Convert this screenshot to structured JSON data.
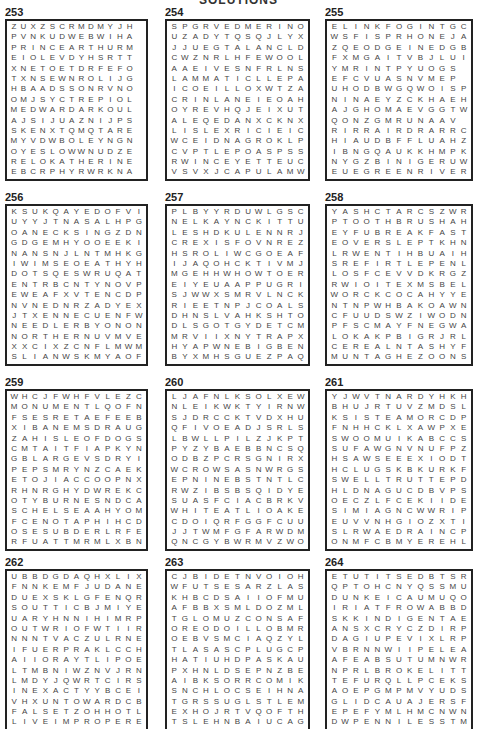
{
  "header": {
    "title": "SOLUTIONS"
  },
  "puzzles": [
    {
      "number": "253",
      "x": 5,
      "y": 6,
      "w": 143,
      "cols": 14,
      "rows": [
        "ZUXZSCRMDMYJH",
        "PVNKUDWEBWIHA",
        "PRINCEARTHURM",
        "EIOLEVDYHSRTT",
        "XNETOETDRFEFO",
        "TXNSEWNROLIJG",
        "HBAADSSONRVNO",
        "OMJSYCTREPIOL",
        "MEDWARDARKOUL",
        "AJSIJUAZNIJPS",
        "SKENXTQMQTARE",
        "MYVDWBOLEYNGN",
        "OYESLOWWNUDZE",
        "RELOKATHERINE",
        "EBCRPHYRWRKNA"
      ]
    },
    {
      "number": "254",
      "x": 165,
      "y": 6,
      "w": 145,
      "cols": 13,
      "rows": [
        "SPGRVEDMERINO",
        "UZADYTQSQJLYX",
        "JJUEGTALANCLD",
        "CWZNRLHFEWOOL",
        "AAEIVESNFRLNS",
        "LAMMATICLLEPAM",
        "ICOEILLOXWTZA",
        "CRINLANEIEOAH",
        "OYREVHQJEIXUT",
        "ALEQEDANXCKNX",
        "LISLEXRICIEIC",
        "WCEIDNAGROKLP",
        "CVPTLEPOASPSS",
        "RWINCEYETTEUC",
        "VSVXJCAPULAMW"
      ]
    },
    {
      "number": "255",
      "x": 325,
      "y": 6,
      "w": 148,
      "cols": 13,
      "rows": [
        "ELINKFOGINTGC",
        "WSFISPRHONEJA",
        "ZQEODGEINEDGB",
        "FXMGAITVBJLUI",
        "YMRINTPYUOGS",
        "EFCVUASNVMEP",
        "UHODBWGQWOISP",
        "NINAEYZCKHAEH",
        "AJGHOMAEVGGTW",
        "QONZGMRUNAAV",
        "RIRRAIRDRARRC",
        "HIAUDBFFLUAHZ",
        "IBNGQAUKKHMPK",
        "NYGZBINIGERUW",
        "EUEGREENRIVER"
      ]
    },
    {
      "number": "256",
      "x": 5,
      "y": 191,
      "w": 143,
      "cols": 13,
      "rows": [
        "KSUKQAYEDOFVI",
        "UYYJTNASALHPG",
        "OANECKSINGZDN",
        "GDGEMHYOOEEKI",
        "NANSNJLNTMHKG",
        "IWIMSEOEATHYH",
        "DOTSQESWRUQAT",
        "ENTRBCNTYNOVP",
        "EWEAFXVTENCDP",
        "NVNEDNRZADYEX",
        "JTXENNECUENFW",
        "NEEDLERBYONON",
        "NORTHERNUVMVE",
        "XXCIXZCNFLMWM",
        "SLIANWSKMYAOF"
      ]
    },
    {
      "number": "257",
      "x": 165,
      "y": 191,
      "w": 145,
      "cols": 13,
      "rows": [
        "PLBYYRDUWLGSC",
        "NELKAYNCKITTU",
        "LESHDKULENNRJ",
        "CREXISFOVNREZ",
        "HSROLIWCGOEAF",
        "IJAQOHCKTIVMJ",
        "MGEHHWHOWTOER",
        "EIYEUAAPPUGRI",
        "SJWWXSMRVLNCK",
        "RIEETNPJCOALS",
        "DHNSLVAHKSHTO",
        "DLSGOTGYDETCM",
        "MRVIIXNYTRAPX",
        "HYAPWNEBIGBEN",
        "BYXMHSGUEZPAQ"
      ]
    },
    {
      "number": "258",
      "x": 325,
      "y": 191,
      "w": 148,
      "cols": 13,
      "rows": [
        "YASHCTARCSZWR",
        "PTOOTHBRUSHAH",
        "EYFUBREAKFAST",
        "EOVERSLEPTKHN",
        "LRWENTIHBUAIH",
        "SREFIRTLEPENL",
        "LOSFCEVVDKRGZ",
        "RWIOITEXMSBEL",
        "WORCKCOCAHYYE",
        "NTNPWHBAKOAWN",
        "CFUUDSWZIWODN",
        "PFSCMAYFNEGWA",
        "LOKAKPBIGRJRL",
        "CEREALNTASHYF",
        "MUNTAGHEZOONS"
      ]
    },
    {
      "number": "259",
      "x": 5,
      "y": 376,
      "w": 143,
      "cols": 13,
      "rows": [
        "WHCJFWHFVLEZC",
        "MONUMENTLQOFN",
        "FSESRETAEFEEB",
        "XIBANEMSDRAUG",
        "ZAHISLEOFDOGS",
        "CMTAITFIAPKYN",
        "GBLARGEVSDRYI",
        "PEPSMRYNZCAEK",
        "ETOJIACCOOPNX",
        "RHNRGHYDWREKC",
        "OTYBURNESNDCA",
        "SCHELSEAAHYOM",
        "FCENOTAPHIHCD",
        "OSESUBDERLRFE",
        "RFUATTMRMLXBN"
      ]
    },
    {
      "number": "260",
      "x": 165,
      "y": 376,
      "w": 145,
      "cols": 13,
      "rows": [
        "LJAFNLKSOLXEW",
        "NLEIKWKTYIRNW",
        "SJDRCCKTVDXHU",
        "QFIVOEADJSRLS",
        "LBWLLPILZJKPT",
        "PYZYBAEBBNCSQ",
        "ODBZPCRSGNIRX",
        "WCROWSASNWRGS",
        "EPNINEBSTNTLC",
        "RWZIBSBSQIDYE",
        "SUASFCIACBRKV",
        "WHITEATLIOAKE",
        "CDOIQRFGGFCUU",
        "JJTWMFGFARWDM",
        "QNCGYBWRMVZWO"
      ]
    },
    {
      "number": "261",
      "x": 325,
      "y": 376,
      "w": 148,
      "cols": 13,
      "rows": [
        "YJWVTNARDYHKH",
        "BHUJRTUVZMDSL",
        "KSISTEAMORCDP",
        "FNHHCKLXAWPXE",
        "SWOOMUIKABCCS",
        "SUFAWGNVNUFPZ",
        "HSAWSEEEXIODT",
        "HCLUGSKBKURKF",
        "SWELLTRUTTEPD",
        "HLDNAGUCDBVPS",
        "OECZLFCEKIIDE",
        "SIMIAGNCWWRIP",
        "EUVVNHGIOZXTI",
        "SLRWAEDRAINCP",
        "ONMFCBMYEREHL"
      ]
    },
    {
      "number": "262",
      "x": 5,
      "y": 556,
      "w": 143,
      "cols": 13,
      "rows": [
        "UBBDGDAQHXLIX",
        "FNNKEMFJUDANE",
        "DUEXSKLGFENQR",
        "SOUTTICBJMIYE",
        "UARYHNNIHIMRP",
        "OUTWRIOFWTIIR",
        "NNNTVACZULRNE",
        "IFUERPRAKLCCH",
        "AIIORAYTLIPOE",
        "LTMBNIWZNVJRN",
        "LMDYJQWRTCIRS",
        "INEXACTYYBCEI",
        "VHXUNTOWARDCB",
        "FALSETZOHHOTL",
        "LIVEIMPROPERE"
      ]
    },
    {
      "number": "263",
      "x": 165,
      "y": 556,
      "w": 145,
      "cols": 13,
      "rows": [
        "CJBIDETNVOIOH",
        "WFUTSESARZLAS",
        "KHBCDSAIIOFMU",
        "AFBBXSMLDOZML",
        "TGLOMUZCONSAF",
        "OREODOILLOBMR",
        "OEBVSMCIAQZYL",
        "TLASASCPLUGCP",
        "HATIUHDPASKAU",
        "PXHNLDSEPNZBE",
        "AIBKSORRCOMIK",
        "SNCHLOCSEIHNA",
        "TGRSSUGLSTLEM",
        "EXHOJRTVQOFTH",
        "TSLEHNBAIUCAG"
      ]
    },
    {
      "number": "264",
      "x": 325,
      "y": 556,
      "w": 148,
      "cols": 13,
      "rows": [
        "ETUTITSEDBTSR",
        "QPTOHCNYQSSMU",
        "DUNKEICAUMUQO",
        "IRIATFROWABBD",
        "SKKINDIGENTAE",
        "ANSXCRYCZDIRP",
        "DAGIUPEVIXLRP",
        "VBRNNWIIPELEA",
        "AFEABSUTUMNWR",
        "NPRLBROKELITT",
        "TEFURQLLPCEKS",
        "AOEPGMPMVYUDS",
        "GLIDCAUAJERSF",
        "EPEFYMLHMCNWN",
        "DWPENNILESSTM"
      ]
    }
  ]
}
